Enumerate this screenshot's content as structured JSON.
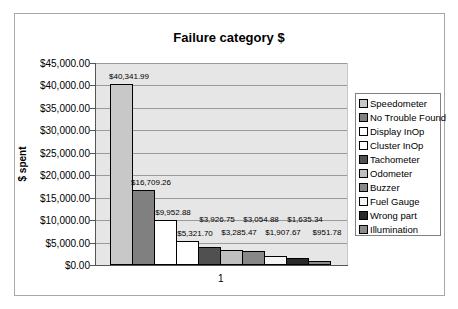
{
  "chart_data": {
    "type": "bar",
    "title": "Failure category $",
    "xlabel": "",
    "ylabel": "$ spent",
    "categories": [
      "1"
    ],
    "ylim": [
      0,
      45000
    ],
    "yticks": [
      "$0.00",
      "$5,000.00",
      "$10,000.00",
      "$15,000.00",
      "$20,000.00",
      "$25,000.00",
      "$30,000.00",
      "$35,000.00",
      "$40,000.00",
      "$45,000.00"
    ],
    "grid": true,
    "legend_position": "right",
    "series": [
      {
        "name": "Speedometer",
        "values": [
          40341.99
        ],
        "label": "$40,341.99",
        "color": "#c8c8c8"
      },
      {
        "name": "No Trouble Found",
        "values": [
          16709.26
        ],
        "label": "$16,709.26",
        "color": "#808080"
      },
      {
        "name": "Display InOp",
        "values": [
          9952.88
        ],
        "label": "$9,952.88",
        "color": "#ffffff"
      },
      {
        "name": "Cluster InOp",
        "values": [
          5321.7
        ],
        "label": "$5,321.70",
        "color": "#ffffff"
      },
      {
        "name": "Tachometer",
        "values": [
          3926.75
        ],
        "label": "$3,926.75",
        "color": "#505050"
      },
      {
        "name": "Odometer",
        "values": [
          3285.47
        ],
        "label": "$3,285.47",
        "color": "#c0c0c0"
      },
      {
        "name": "Buzzer",
        "values": [
          3054.88
        ],
        "label": "$3,054.88",
        "color": "#888888"
      },
      {
        "name": "Fuel Gauge",
        "values": [
          1907.67
        ],
        "label": "$1,907.67",
        "color": "#f4f4f4"
      },
      {
        "name": "Wrong part",
        "values": [
          1635.34
        ],
        "label": "$1,635.34",
        "color": "#2a2a2a"
      },
      {
        "name": "Illumination",
        "values": [
          951.78
        ],
        "label": "$951.78",
        "color": "#8c8c8c"
      }
    ]
  }
}
